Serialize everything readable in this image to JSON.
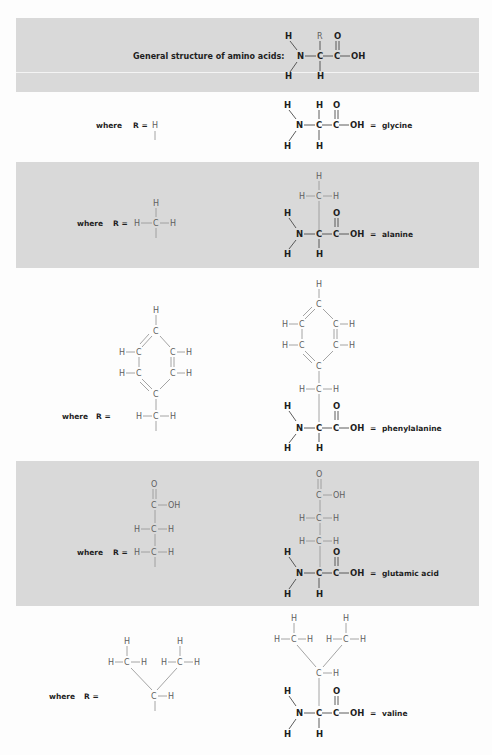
{
  "title": "General structure of amino acids:",
  "general": {
    "atoms": [
      "H",
      "N",
      "H",
      "R",
      "C",
      "H",
      "O",
      "C",
      "OH"
    ]
  },
  "colors": {
    "band": "#d9d9d9",
    "backbone": "#1e1e1e",
    "side_chain": "#5e5e5e",
    "background": "#fdfdfd"
  },
  "where_label": "where",
  "r_equals": "R =",
  "equals": "=",
  "atoms": {
    "H": "H",
    "C": "C",
    "N": "N",
    "O": "O",
    "OH": "OH",
    "R": "R"
  },
  "amino_acids": [
    {
      "name": "glycine",
      "r_group": "H"
    },
    {
      "name": "alanine",
      "r_group": "CH3"
    },
    {
      "name": "phenylalanine",
      "r_group": "CH2-C6H5"
    },
    {
      "name": "glutamic acid",
      "r_group": "CH2-CH2-COOH"
    },
    {
      "name": "valine",
      "r_group": "CH(CH3)2"
    }
  ]
}
